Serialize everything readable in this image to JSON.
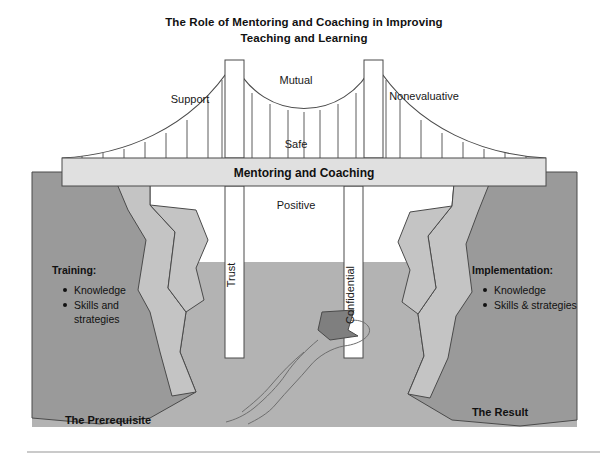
{
  "figure": {
    "title_line1": "The Role of Mentoring and Coaching in Improving",
    "title_line2": "Teaching and Learning",
    "deck_label": "Mentoring and Coaching",
    "cable_labels": {
      "left": "Support",
      "center_top": "Mutual",
      "center_bottom": "Safe",
      "right": "Nonevaluative"
    },
    "pillar_labels": {
      "left": "Trust",
      "right": "Confidential"
    },
    "water_label": "Positive",
    "left_cliff": {
      "heading": "Training:",
      "items": [
        "Knowledge",
        "Skills and",
        "strategies"
      ],
      "caption": "The Prerequisite"
    },
    "right_cliff": {
      "heading": "Implementation:",
      "items": [
        "Knowledge",
        "Skills & strategies"
      ],
      "caption": "The Result"
    },
    "colors": {
      "cliff_dark": "#9a9a9a",
      "cliff_light": "#c4c4c4",
      "water": "#b3b3b3",
      "deck": "#e0e0e0",
      "boat": "#8c8c8c",
      "outline": "#444444",
      "rule": "#b8b8b8"
    }
  }
}
